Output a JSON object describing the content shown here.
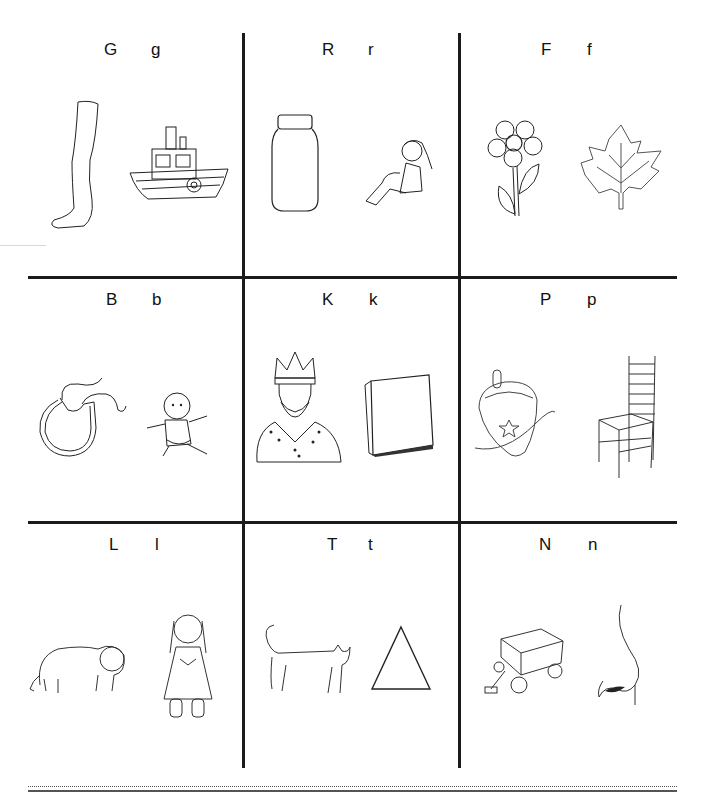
{
  "worksheet": {
    "cells": [
      {
        "upper": "G",
        "lower": "g",
        "pictures": [
          "leg",
          "boat"
        ]
      },
      {
        "upper": "R",
        "lower": "r",
        "pictures": [
          "jar",
          "girl-sitting"
        ]
      },
      {
        "upper": "F",
        "lower": "f",
        "pictures": [
          "flower",
          "leaf"
        ]
      },
      {
        "upper": "B",
        "lower": "b",
        "pictures": [
          "bib",
          "baby"
        ]
      },
      {
        "upper": "K",
        "lower": "k",
        "pictures": [
          "king",
          "book"
        ]
      },
      {
        "upper": "P",
        "lower": "p",
        "pictures": [
          "top",
          "chair"
        ]
      },
      {
        "upper": "L",
        "lower": "l",
        "pictures": [
          "lion",
          "doll"
        ]
      },
      {
        "upper": "T",
        "lower": "t",
        "pictures": [
          "cat",
          "triangle"
        ]
      },
      {
        "upper": "N",
        "lower": "n",
        "pictures": [
          "wagon",
          "nose"
        ]
      }
    ]
  }
}
